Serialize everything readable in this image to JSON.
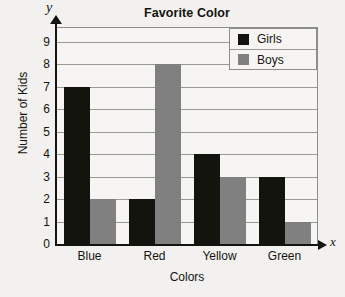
{
  "chart_data": {
    "type": "bar",
    "title": "Favorite Color",
    "xlabel": "Colors",
    "ylabel": "Number of Kids",
    "x_axis_symbol": "x",
    "y_axis_symbol": "y",
    "categories": [
      "Blue",
      "Red",
      "Yellow",
      "Green"
    ],
    "series": [
      {
        "name": "Girls",
        "color": "#14140f",
        "values": [
          7,
          2,
          4,
          3
        ]
      },
      {
        "name": "Boys",
        "color": "#808080",
        "values": [
          2,
          8,
          3,
          1
        ]
      }
    ],
    "yticks": [
      0,
      1,
      2,
      3,
      4,
      5,
      6,
      7,
      8,
      9
    ],
    "ylim": [
      0,
      9.6
    ],
    "grid": true,
    "legend_position": "top-right"
  },
  "colors": {
    "girls": "#14140f",
    "boys": "#808080",
    "grid": "#9a9a95",
    "frame": "#8d8d89",
    "axis": "#14140f",
    "plot_background": "#f6f5f3",
    "page_background": "#f2f1ef"
  }
}
